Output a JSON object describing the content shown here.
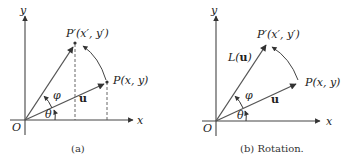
{
  "panels": [
    {
      "id": "a",
      "caption": "(a)",
      "labels": {
        "y_axis": "y",
        "x_axis": "x",
        "origin": "O",
        "p_prime": "P′(x′, y′)",
        "p": "P(x, y)",
        "u": "u",
        "phi": "φ",
        "theta": "θ"
      }
    },
    {
      "id": "b",
      "caption": "(b)  Rotation.",
      "labels": {
        "y_axis": "y",
        "x_axis": "x",
        "origin": "O",
        "p_prime": "P′(x′, y′)",
        "p": "P(x, y)",
        "u": "u",
        "l_u": "L(u)",
        "phi": "φ",
        "theta": "θ"
      }
    }
  ],
  "colors": {
    "line": "#555555",
    "text": "#222222"
  }
}
